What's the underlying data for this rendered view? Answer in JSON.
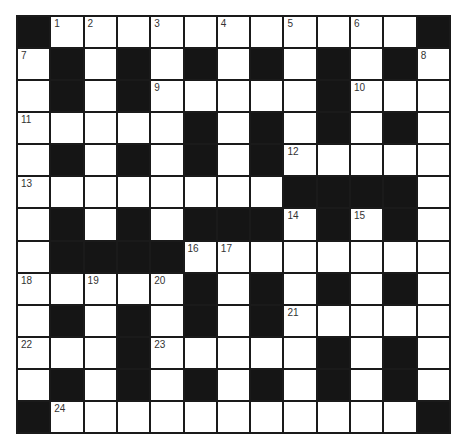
{
  "puzzle": {
    "rows": 13,
    "cols": 13,
    "grid": [
      [
        "#",
        "1",
        "2",
        "",
        "3",
        "",
        "4",
        "",
        "5",
        "",
        "6",
        "",
        "#"
      ],
      [
        "7",
        "#",
        "",
        "#",
        "",
        "#",
        "",
        "#",
        "",
        "#",
        "",
        "#",
        "8"
      ],
      [
        "",
        "#",
        "",
        "#",
        "9",
        "",
        "",
        "",
        "",
        "#",
        "10",
        "",
        ""
      ],
      [
        "11",
        "",
        "",
        "",
        "",
        "#",
        "",
        "#",
        "",
        "#",
        "",
        "#",
        ""
      ],
      [
        "",
        "#",
        "",
        "#",
        "",
        "#",
        "",
        "#",
        "12",
        "",
        "",
        "",
        ""
      ],
      [
        "13",
        "",
        "",
        "",
        "",
        "",
        "",
        "",
        "#",
        "#",
        "#",
        "#",
        ""
      ],
      [
        "",
        "#",
        "",
        "#",
        "",
        "#",
        "#",
        "#",
        "14",
        "#",
        "15",
        "#",
        ""
      ],
      [
        "",
        "#",
        "#",
        "#",
        "#",
        "16",
        "17",
        "",
        "",
        "",
        "",
        "",
        ""
      ],
      [
        "18",
        "",
        "19",
        "",
        "20",
        "#",
        "",
        "#",
        "",
        "#",
        "",
        "#",
        ""
      ],
      [
        "",
        "#",
        "",
        "#",
        "",
        "#",
        "",
        "#",
        "21",
        "",
        "",
        "",
        ""
      ],
      [
        "22",
        "",
        "",
        "#",
        "23",
        "",
        "",
        "",
        "",
        "#",
        "",
        "#",
        ""
      ],
      [
        "",
        "#",
        "",
        "#",
        "",
        "#",
        "",
        "#",
        "",
        "#",
        "",
        "#",
        ""
      ],
      [
        "#",
        "24",
        "",
        "",
        "",
        "",
        "",
        "",
        "",
        "",
        "",
        "",
        "#"
      ]
    ],
    "entries": []
  },
  "colors": {
    "black_cell": "#151515",
    "white_cell": "#ffffff",
    "grid_line": "#1a1a1a",
    "number_text": "#333333"
  }
}
